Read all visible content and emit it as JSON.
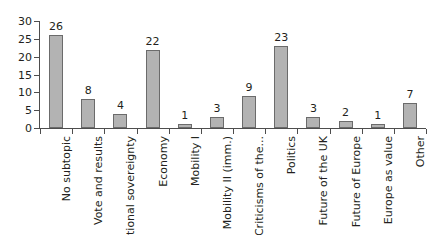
{
  "chart_data": {
    "type": "bar",
    "title": "",
    "subtitle": "",
    "xlabel": "",
    "ylabel": "",
    "ylim": [
      0,
      30
    ],
    "y_ticks": [
      0,
      5,
      10,
      15,
      20,
      25,
      30
    ],
    "grid": false,
    "legend": "none",
    "orientation": "vertical",
    "bar_color": "#b3b3b3",
    "bar_edge_color": "#6b6b6b",
    "axis_color": "#4d4d4d",
    "text_color": "#231f20",
    "background_color": "#ffffff",
    "data_labels_shown": true,
    "x_tick_label_rotation": 90,
    "categories": [
      "No subtopic",
      "Vote and results",
      "National sovereignty",
      "Economy",
      "Mobility I",
      "Mobility II (imm.)",
      "Criticisms of the...",
      "Politics",
      "Future of the UK",
      "Future of Europe",
      "Europe as value",
      "Other"
    ],
    "values": [
      26,
      8,
      4,
      22,
      1,
      3,
      9,
      23,
      3,
      2,
      1,
      7
    ],
    "series": [
      {
        "name": "Count",
        "values": [
          26,
          8,
          4,
          22,
          1,
          3,
          9,
          23,
          3,
          2,
          1,
          7
        ]
      }
    ]
  }
}
